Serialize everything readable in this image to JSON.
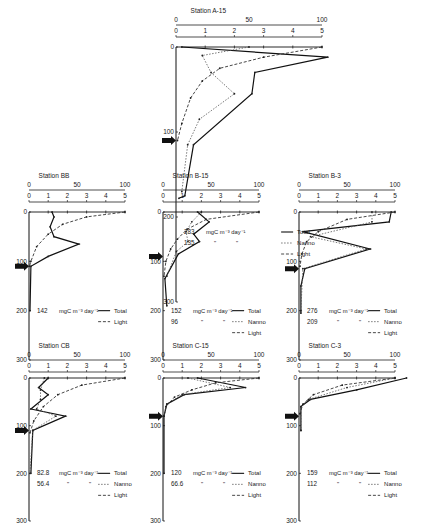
{
  "figure": {
    "top_scale_ticks": [
      "0",
      "50",
      "100"
    ],
    "bottom_scale_ticks": [
      "0",
      "1",
      "2",
      "3",
      "4",
      "5"
    ],
    "depth_ticks": [
      "0",
      "100",
      "200",
      "300"
    ],
    "unit_label": "mgC m⁻³ day⁻¹",
    "ditto": "\"",
    "legend": {
      "total": "Total",
      "nanno": "Nanno",
      "light": "Light"
    }
  },
  "chart_data": [
    {
      "type": "line",
      "title": "Station A-15",
      "ylabel": "Depth",
      "ylim": [
        0,
        300
      ],
      "xlim_production": [
        0,
        5
      ],
      "xlim_light": [
        0,
        100
      ],
      "integrated": {
        "total": "283",
        "nanno": "135"
      },
      "legend": [
        "Total",
        "Nanno",
        "Light"
      ],
      "arrow_depth": 110,
      "series": [
        {
          "name": "Total",
          "points": [
            [
              0.2,
              0
            ],
            [
              5.2,
              12
            ],
            [
              2.7,
              30
            ],
            [
              2.6,
              55
            ],
            [
              0.6,
              115
            ],
            [
              0.3,
              175
            ],
            [
              0.1,
              178
            ]
          ]
        },
        {
          "name": "Nanno",
          "points": [
            [
              2.5,
              0
            ],
            [
              0.9,
              10
            ],
            [
              1.2,
              30
            ],
            [
              2.0,
              55
            ],
            [
              0.8,
              85
            ],
            [
              0.4,
              115
            ],
            [
              0.2,
              170
            ]
          ]
        },
        {
          "name": "Light",
          "points": [
            [
              100,
              0
            ],
            [
              60,
              12
            ],
            [
              30,
              25
            ],
            [
              18,
              40
            ],
            [
              10,
              60
            ],
            [
              4,
              90
            ],
            [
              1,
              110
            ]
          ]
        }
      ]
    },
    {
      "type": "line",
      "title": "Station BB",
      "ylabel": "Depth",
      "ylim": [
        0,
        300
      ],
      "xlim_production": [
        0,
        5
      ],
      "xlim_light": [
        0,
        100
      ],
      "integrated": {
        "total": "142"
      },
      "legend": [
        "Total",
        "Light"
      ],
      "arrow_depth": 110,
      "series": [
        {
          "name": "Total",
          "points": [
            [
              1.2,
              0
            ],
            [
              1.3,
              10
            ],
            [
              1.1,
              30
            ],
            [
              1.3,
              50
            ],
            [
              2.6,
              65
            ],
            [
              1.0,
              90
            ],
            [
              0.1,
              110
            ],
            [
              0.05,
              200
            ]
          ]
        },
        {
          "name": "Light",
          "points": [
            [
              100,
              0
            ],
            [
              60,
              10
            ],
            [
              35,
              25
            ],
            [
              20,
              45
            ],
            [
              8,
              70
            ],
            [
              2,
              100
            ],
            [
              0.5,
              110
            ]
          ]
        }
      ]
    },
    {
      "type": "line",
      "title": "Station B-15",
      "ylabel": "Depth",
      "ylim": [
        0,
        300
      ],
      "xlim_production": [
        0,
        5
      ],
      "xlim_light": [
        0,
        100
      ],
      "integrated": {
        "total": "152",
        "nanno": "96"
      },
      "legend": [
        "Total",
        "Nanno",
        "Light"
      ],
      "arrow_depth": 90,
      "series": [
        {
          "name": "Total",
          "points": [
            [
              1.8,
              0
            ],
            [
              2.4,
              20
            ],
            [
              1.6,
              45
            ],
            [
              1.9,
              60
            ],
            [
              0.8,
              85
            ],
            [
              0.1,
              135
            ],
            [
              0.2,
              190
            ]
          ]
        },
        {
          "name": "Nanno",
          "points": [
            [
              2.0,
              0
            ],
            [
              1.5,
              20
            ],
            [
              1.2,
              40
            ],
            [
              1.3,
              60
            ],
            [
              0.7,
              80
            ],
            [
              0.2,
              130
            ]
          ]
        },
        {
          "name": "Light",
          "points": [
            [
              100,
              0
            ],
            [
              45,
              15
            ],
            [
              25,
              35
            ],
            [
              15,
              55
            ],
            [
              8,
              75
            ],
            [
              3,
              100
            ],
            [
              1,
              130
            ]
          ]
        }
      ]
    },
    {
      "type": "line",
      "title": "Station B-3",
      "ylabel": "Depth",
      "ylim": [
        0,
        300
      ],
      "xlim_production": [
        0,
        5
      ],
      "xlim_light": [
        0,
        100
      ],
      "integrated": {
        "total": "276",
        "nanno": "209"
      },
      "legend": [
        "Total",
        "Nanno",
        "Light"
      ],
      "arrow_depth": 115,
      "series": [
        {
          "name": "Total",
          "points": [
            [
              4.8,
              0
            ],
            [
              4.7,
              20
            ],
            [
              0.2,
              40
            ],
            [
              3.7,
              75
            ],
            [
              0.3,
              115
            ],
            [
              0.1,
              150
            ],
            [
              0.1,
              205
            ]
          ]
        },
        {
          "name": "Nanno",
          "points": [
            [
              3.8,
              0
            ],
            [
              3.8,
              20
            ],
            [
              0.6,
              50
            ],
            [
              3.5,
              75
            ],
            [
              0.2,
              115
            ],
            [
              0.1,
              200
            ]
          ]
        },
        {
          "name": "Light",
          "points": [
            [
              100,
              0
            ],
            [
              50,
              15
            ],
            [
              20,
              40
            ],
            [
              8,
              60
            ],
            [
              3,
              85
            ],
            [
              1,
              110
            ]
          ]
        }
      ]
    },
    {
      "type": "line",
      "title": "Station CB",
      "ylabel": "Depth",
      "ylim": [
        0,
        300
      ],
      "xlim_production": [
        0,
        5
      ],
      "xlim_light": [
        0,
        100
      ],
      "integrated": {
        "total": "82.8",
        "nanno": "56.4"
      },
      "legend": [
        "Total",
        "Nanno",
        "Light"
      ],
      "arrow_depth": 110,
      "series": [
        {
          "name": "Total",
          "points": [
            [
              1.0,
              0
            ],
            [
              0.5,
              20
            ],
            [
              1.0,
              35
            ],
            [
              0.1,
              65
            ],
            [
              1.9,
              80
            ],
            [
              0.2,
              110
            ],
            [
              0.1,
              200
            ]
          ]
        },
        {
          "name": "Nanno",
          "points": [
            [
              0.8,
              0
            ],
            [
              0.6,
              25
            ],
            [
              0.6,
              45
            ],
            [
              0.4,
              65
            ],
            [
              1.4,
              80
            ],
            [
              0.2,
              110
            ],
            [
              0.05,
              200
            ]
          ]
        },
        {
          "name": "Light",
          "points": [
            [
              100,
              0
            ],
            [
              55,
              15
            ],
            [
              30,
              35
            ],
            [
              15,
              60
            ],
            [
              5,
              90
            ],
            [
              1,
              115
            ]
          ]
        }
      ]
    },
    {
      "type": "line",
      "title": "Station C-15",
      "ylabel": "Depth",
      "ylim": [
        0,
        300
      ],
      "xlim_production": [
        0,
        5
      ],
      "xlim_light": [
        0,
        100
      ],
      "integrated": {
        "total": "120",
        "nanno": "66.6"
      },
      "legend": [
        "Total",
        "Nanno",
        "Light"
      ],
      "arrow_depth": 80,
      "series": [
        {
          "name": "Total",
          "points": [
            [
              1.8,
              0
            ],
            [
              4.3,
              20
            ],
            [
              1.1,
              35
            ],
            [
              0.2,
              55
            ],
            [
              0.05,
              80
            ],
            [
              0.05,
              200
            ]
          ]
        },
        {
          "name": "Nanno",
          "points": [
            [
              1.3,
              0
            ],
            [
              3.5,
              20
            ],
            [
              1.0,
              35
            ],
            [
              0.2,
              55
            ],
            [
              0.05,
              80
            ]
          ]
        },
        {
          "name": "Light",
          "points": [
            [
              100,
              0
            ],
            [
              55,
              10
            ],
            [
              30,
              25
            ],
            [
              12,
              40
            ],
            [
              3,
              60
            ],
            [
              1,
              80
            ]
          ]
        }
      ]
    },
    {
      "type": "line",
      "title": "Station C-3",
      "ylabel": "Depth",
      "ylim": [
        0,
        300
      ],
      "xlim_production": [
        0,
        5
      ],
      "xlim_light": [
        0,
        100
      ],
      "integrated": {
        "total": "159",
        "nanno": "112"
      },
      "legend": [
        "Total",
        "Nanno",
        "Light"
      ],
      "arrow_depth": 80,
      "series": [
        {
          "name": "Total",
          "points": [
            [
              5.6,
              0
            ],
            [
              3.0,
              25
            ],
            [
              0.6,
              45
            ],
            [
              0.1,
              60
            ],
            [
              0.1,
              110
            ]
          ]
        },
        {
          "name": "Nanno",
          "points": [
            [
              5.0,
              0
            ],
            [
              2.5,
              20
            ],
            [
              0.5,
              45
            ],
            [
              0.1,
              60
            ],
            [
              0.1,
              110
            ]
          ]
        },
        {
          "name": "Light",
          "points": [
            [
              100,
              0
            ],
            [
              45,
              15
            ],
            [
              15,
              35
            ],
            [
              4,
              55
            ],
            [
              1,
              75
            ]
          ]
        }
      ]
    }
  ],
  "layout": [
    {
      "x0": 176,
      "y0": 47,
      "w": 146,
      "yh": 255
    },
    {
      "x0": 29,
      "y0": 188,
      "w": 96,
      "yh": 287
    },
    {
      "x0": 163,
      "y0": 188,
      "w": 96,
      "yh": 287
    },
    {
      "x0": 299,
      "y0": 188,
      "w": 96,
      "yh": 287
    },
    {
      "x0": 29,
      "y0": 376,
      "w": 96,
      "yh": 287
    },
    {
      "x0": 163,
      "y0": 376,
      "w": 96,
      "yh": 287
    },
    {
      "x0": 299,
      "y0": 376,
      "w": 96,
      "yh": 287
    }
  ]
}
